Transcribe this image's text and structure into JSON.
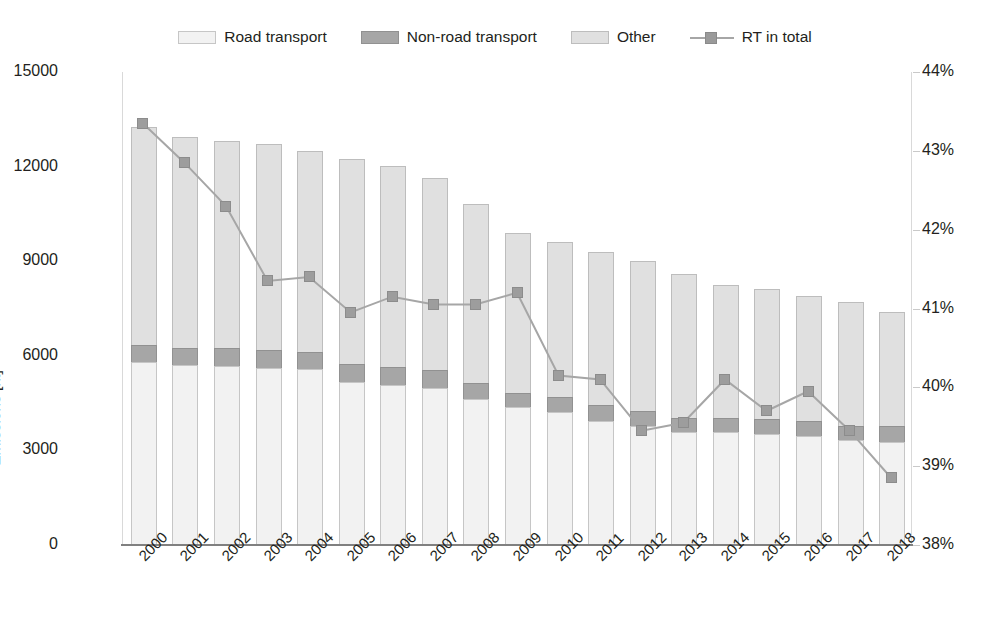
{
  "chart_data": {
    "type": "bar",
    "title": "",
    "subtitle": "",
    "xlabel": "",
    "ylabel": "Emissions [kt]",
    "y2label": "",
    "grid": false,
    "legend_position": "top-center",
    "categories": [
      "2000",
      "2001",
      "2002",
      "2003",
      "2004",
      "2005",
      "2006",
      "2007",
      "2008",
      "2009",
      "2010",
      "2011",
      "2012",
      "2013",
      "2014",
      "2015",
      "2016",
      "2017",
      "2018"
    ],
    "ylim": [
      0,
      15000
    ],
    "yticks": [
      "0",
      "3000",
      "6000",
      "9000",
      "12000",
      "15000"
    ],
    "y2lim": [
      38,
      44
    ],
    "y2ticks": [
      "38%",
      "39%",
      "40%",
      "41%",
      "42%",
      "43%",
      "44%"
    ],
    "series": [
      {
        "name": "Road transport",
        "type": "bar",
        "stack": "emissions",
        "color": "#f2f2f2",
        "values": [
          5850,
          5750,
          5700,
          5650,
          5600,
          5200,
          5100,
          5000,
          4650,
          4400,
          4250,
          3950,
          3800,
          3600,
          3600,
          3550,
          3500,
          3350,
          3300
        ]
      },
      {
        "name": "Non-road transport",
        "type": "bar",
        "stack": "emissions",
        "color": "#a6a6a6",
        "values": [
          550,
          550,
          600,
          600,
          600,
          600,
          600,
          600,
          550,
          500,
          500,
          550,
          500,
          500,
          500,
          500,
          500,
          500,
          550
        ]
      },
      {
        "name": "Other",
        "type": "bar",
        "stack": "emissions",
        "color": "#e0e0e0",
        "values": [
          6950,
          6750,
          6600,
          6550,
          6400,
          6550,
          6400,
          6150,
          5700,
          5100,
          4950,
          4900,
          4800,
          4600,
          4250,
          4150,
          4000,
          3950,
          3650
        ]
      },
      {
        "name": "RT in total",
        "type": "line",
        "axis": "right",
        "unit": "%",
        "color": "#9d9d9d",
        "marker": "square",
        "values": [
          43.35,
          42.85,
          42.3,
          41.35,
          41.4,
          40.95,
          41.15,
          41.05,
          41.05,
          41.2,
          40.15,
          40.1,
          39.45,
          39.55,
          40.1,
          39.7,
          39.95,
          39.45,
          38.85
        ]
      }
    ],
    "totals": [
      13350,
      13050,
      12900,
      12800,
      12600,
      12350,
      12100,
      11750,
      10900,
      10000,
      9700,
      9400,
      9100,
      8700,
      8350,
      8200,
      8000,
      7800,
      7500
    ]
  },
  "legend": {
    "items": [
      {
        "label": "Road transport",
        "swatch": "legend-swatch-road",
        "color": "#f2f2f2"
      },
      {
        "label": "Non-road transport",
        "swatch": "legend-swatch-nonroad",
        "color": "#a6a6a6"
      },
      {
        "label": "Other",
        "swatch": "legend-swatch-other",
        "color": "#e0e0e0"
      },
      {
        "label": "RT in total",
        "swatch": "legend-line-rt",
        "color": "#9d9d9d"
      }
    ]
  }
}
